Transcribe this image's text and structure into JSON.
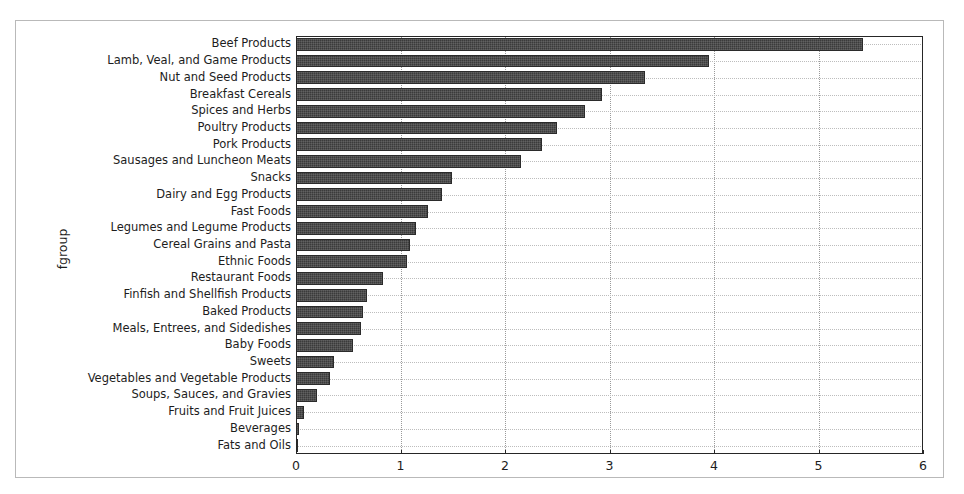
{
  "chart_data": {
    "type": "bar",
    "orientation": "horizontal",
    "title": "",
    "xlabel": "",
    "ylabel": "fgroup",
    "xlim": [
      0,
      6
    ],
    "ylim": null,
    "grid": true,
    "legend": null,
    "xticks": [
      "0",
      "1",
      "2",
      "3",
      "4",
      "5",
      "6"
    ],
    "xtick_values": [
      0,
      1,
      2,
      3,
      4,
      5,
      6
    ],
    "bar_color": "#3b3b3b",
    "categories": [
      "Beef Products",
      "Lamb, Veal, and Game Products",
      "Nut and Seed Products",
      "Breakfast Cereals",
      "Spices and Herbs",
      "Poultry Products",
      "Pork Products",
      "Sausages and Luncheon Meats",
      "Snacks",
      "Dairy and Egg Products",
      "Fast Foods",
      "Legumes and Legume Products",
      "Cereal Grains and Pasta",
      "Ethnic Foods",
      "Restaurant Foods",
      "Finfish and Shellfish Products",
      "Baked Products",
      "Meals, Entrees, and Sidedishes",
      "Baby Foods",
      "Sweets",
      "Vegetables and Vegetable Products",
      "Soups, Sauces, and Gravies",
      "Fruits and Fruit Juices",
      "Beverages",
      "Fats and Oils"
    ],
    "values": [
      5.43,
      3.95,
      3.34,
      2.93,
      2.77,
      2.5,
      2.35,
      2.15,
      1.49,
      1.4,
      1.26,
      1.15,
      1.09,
      1.06,
      0.83,
      0.68,
      0.64,
      0.62,
      0.55,
      0.36,
      0.33,
      0.2,
      0.08,
      0.03,
      0.01
    ]
  }
}
